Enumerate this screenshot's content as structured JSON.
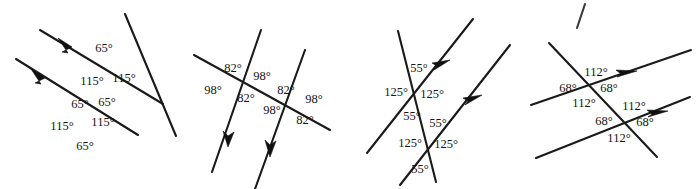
{
  "page": {
    "background_color": "#ffffff",
    "line_color": "#1a1a1a",
    "text_color": "#151515",
    "width": 699,
    "height": 189,
    "degree_symbol": "°"
  },
  "figures": [
    {
      "id": "figure-1",
      "name": "figure-1-65-115",
      "angle_pair": [
        65,
        115
      ],
      "labels": [
        {
          "name": "fig1-label-65-a",
          "text": "65°",
          "x": 104,
          "y": 52
        },
        {
          "name": "fig1-label-115-a",
          "text": "115°",
          "x": 92,
          "y": 85
        },
        {
          "name": "fig1-label-115-b",
          "text": "115°",
          "x": 124,
          "y": 82
        },
        {
          "name": "fig1-label-65-b",
          "text": "65°",
          "x": 80,
          "y": 108
        },
        {
          "name": "fig1-label-65-c",
          "text": "65°",
          "x": 107,
          "y": 106
        },
        {
          "name": "fig1-label-115-c",
          "text": "115°",
          "x": 62,
          "y": 130
        },
        {
          "name": "fig1-label-115-d",
          "text": "115°",
          "x": 103,
          "y": 126
        },
        {
          "name": "fig1-label-65-d",
          "text": "65°",
          "x": 85,
          "y": 150
        }
      ]
    },
    {
      "id": "figure-2",
      "name": "figure-2-82-98",
      "angle_pair": [
        82,
        98
      ],
      "labels": [
        {
          "name": "fig2-label-82-a",
          "text": "82°",
          "x": 233,
          "y": 72
        },
        {
          "name": "fig2-label-98-a",
          "text": "98°",
          "x": 262,
          "y": 80
        },
        {
          "name": "fig2-label-98-b",
          "text": "98°",
          "x": 213,
          "y": 94
        },
        {
          "name": "fig2-label-82-b",
          "text": "82°",
          "x": 246,
          "y": 102
        },
        {
          "name": "fig2-label-82-c",
          "text": "82°",
          "x": 286,
          "y": 94
        },
        {
          "name": "fig2-label-98-c",
          "text": "98°",
          "x": 314,
          "y": 103
        },
        {
          "name": "fig2-label-98-d",
          "text": "98°",
          "x": 272,
          "y": 114
        },
        {
          "name": "fig2-label-82-d",
          "text": "82°",
          "x": 305,
          "y": 124
        }
      ]
    },
    {
      "id": "figure-3",
      "name": "figure-3-55-125",
      "angle_pair": [
        55,
        125
      ],
      "labels": [
        {
          "name": "fig3-label-55-a",
          "text": "55°",
          "x": 419,
          "y": 72
        },
        {
          "name": "fig3-label-125-a",
          "text": "125°",
          "x": 396,
          "y": 96
        },
        {
          "name": "fig3-label-125-b",
          "text": "125°",
          "x": 432,
          "y": 98
        },
        {
          "name": "fig3-label-55-b",
          "text": "55°",
          "x": 412,
          "y": 120
        },
        {
          "name": "fig3-label-55-c",
          "text": "55°",
          "x": 438,
          "y": 127
        },
        {
          "name": "fig3-label-125-c",
          "text": "125°",
          "x": 410,
          "y": 147
        },
        {
          "name": "fig3-label-125-d",
          "text": "125°",
          "x": 446,
          "y": 148
        },
        {
          "name": "fig3-label-55-d",
          "text": "55°",
          "x": 420,
          "y": 173
        }
      ]
    },
    {
      "id": "figure-4",
      "name": "figure-4-68-112",
      "angle_pair": [
        68,
        112
      ],
      "labels": [
        {
          "name": "fig4-label-112-a",
          "text": "112°",
          "x": 596,
          "y": 76
        },
        {
          "name": "fig4-label-68-a",
          "text": "68°",
          "x": 568,
          "y": 92
        },
        {
          "name": "fig4-label-68-b",
          "text": "68°",
          "x": 609,
          "y": 92
        },
        {
          "name": "fig4-label-112-b",
          "text": "112°",
          "x": 584,
          "y": 107
        },
        {
          "name": "fig4-label-112-c",
          "text": "112°",
          "x": 634,
          "y": 110
        },
        {
          "name": "fig4-label-68-c",
          "text": "68°",
          "x": 604,
          "y": 125
        },
        {
          "name": "fig4-label-68-d",
          "text": "68°",
          "x": 645,
          "y": 126
        },
        {
          "name": "fig4-label-112-c2",
          "text": "112°",
          "x": 619,
          "y": 142
        }
      ]
    }
  ]
}
